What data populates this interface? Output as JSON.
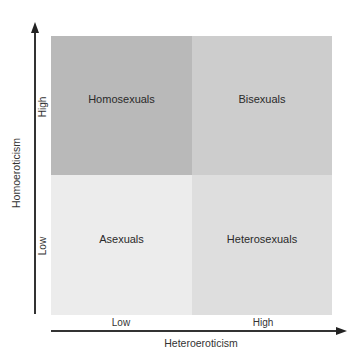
{
  "diagram": {
    "type": "2x2-quadrant",
    "x_axis": {
      "label": "Heteroeroticism",
      "ticks": [
        "Low",
        "High"
      ]
    },
    "y_axis": {
      "label": "Homoeroticism",
      "ticks": [
        "High",
        "Low"
      ]
    },
    "quadrants": {
      "top_left": {
        "label": "Homosexuals",
        "color": "#b9b9b9"
      },
      "top_right": {
        "label": "Bisexuals",
        "color": "#cdcdcd"
      },
      "bottom_left": {
        "label": "Asexuals",
        "color": "#ececec"
      },
      "bottom_right": {
        "label": "Heterosexuals",
        "color": "#dedede"
      }
    },
    "axis_color": "#333333"
  }
}
